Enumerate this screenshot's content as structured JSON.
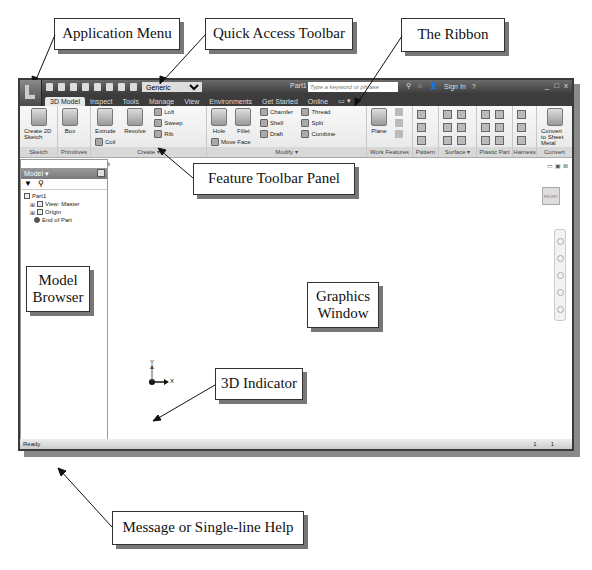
{
  "window": {
    "title": "Part1",
    "quick_access_style": "Generic",
    "search_placeholder": "Type a keyword or phrase",
    "sign_in": "Sign In",
    "window_controls": [
      "_",
      "□",
      "x"
    ]
  },
  "tabs": [
    "3D Model",
    "Inspect",
    "Tools",
    "Manage",
    "View",
    "Environments",
    "Get Started",
    "Online",
    "▭ ▾"
  ],
  "active_tab": "3D Model",
  "ribbon": {
    "panels": [
      {
        "label": "Sketch",
        "big": [
          "Create 2D Sketch"
        ]
      },
      {
        "label": "Primitives",
        "big": [
          "Box"
        ]
      },
      {
        "label": "Create ▾",
        "big": [
          "Extrude",
          "Revolve"
        ],
        "small": [
          [
            "Loft",
            "Sweep",
            "Rib"
          ],
          [
            "Coil",
            "Emboss",
            "Derive"
          ]
        ]
      },
      {
        "label": "Modify ▾",
        "big": [
          "Hole",
          "Fillet"
        ],
        "small": [
          [
            "Chamfer",
            "Shell",
            "Draft"
          ],
          [
            "Thread",
            "Split",
            "Combine"
          ],
          [
            "Move Face",
            "Copy Object",
            "Move Bodies"
          ]
        ]
      },
      {
        "label": "Work Features",
        "big": [
          "Plane"
        ]
      },
      {
        "label": "Pattern"
      },
      {
        "label": "Surface ▾"
      },
      {
        "label": "Plastic Part"
      },
      {
        "label": "Harness"
      },
      {
        "label": "Convert",
        "big": [
          "Convert to Sheet Metal"
        ]
      }
    ]
  },
  "browser": {
    "title": "Model ▾",
    "tree": [
      "Part1",
      "View: Master",
      "Origin",
      "End of Part"
    ]
  },
  "graphics": {
    "viewcube": "FRONT",
    "axis_x": "X",
    "axis_y": "Y"
  },
  "status": {
    "message": "Ready",
    "num1": "1",
    "num2": "1"
  },
  "callouts": {
    "app_menu": "Application Menu",
    "qat": "Quick Access Toolbar",
    "ribbon": "The Ribbon",
    "feature_panel": "Feature Toolbar Panel",
    "model_browser": "Model Browser",
    "graphics_window": "Graphics Window",
    "indicator": "3D Indicator",
    "message": "Message or Single-line Help"
  }
}
